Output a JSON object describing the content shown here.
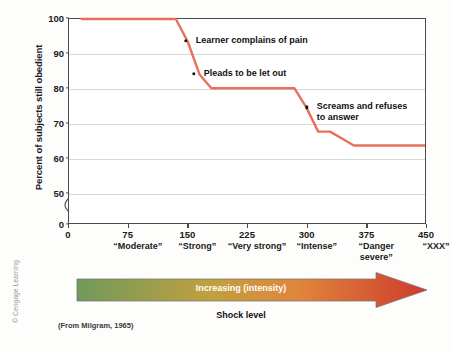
{
  "chart_data": {
    "type": "line",
    "title": "",
    "subtitle": "",
    "xlabel": "Shock level",
    "ylabel": "Percent of subjects still obedient",
    "xlim": [
      0,
      450
    ],
    "ylim": [
      0,
      100
    ],
    "y_axis_break": true,
    "y_axis_break_between": [
      0,
      50
    ],
    "grid": true,
    "grid_axis": "y",
    "legend": "none",
    "line_color": "#e8705a",
    "marker_color": "#111111",
    "x": [
      15,
      135,
      150,
      165,
      180,
      285,
      300,
      315,
      330,
      345,
      360,
      450
    ],
    "y": [
      100,
      100,
      93.5,
      84,
      80,
      80,
      74.5,
      67.5,
      67.5,
      65.5,
      63.5,
      63.5
    ],
    "series": [
      {
        "name": "Percent of subjects still obedient",
        "values": [
          100,
          100,
          93.5,
          84,
          80,
          80,
          74.5,
          67.5,
          67.5,
          65.5,
          63.5,
          63.5
        ]
      }
    ],
    "y_ticks": [
      0,
      50,
      60,
      70,
      80,
      90,
      100
    ],
    "x_ticks": [
      0,
      75,
      150,
      225,
      300,
      375,
      450
    ],
    "x_tick_words": [
      "",
      "“Moderate”",
      "“Strong”",
      "“Very strong”",
      "“Intense”",
      "“Danger\nsevere”",
      "“XXX”"
    ],
    "annotations": [
      {
        "text": "Learner complains of pain",
        "point_x": 148,
        "point_y": 93.5
      },
      {
        "text": "Pleads to be let out",
        "point_x": 158,
        "point_y": 84
      },
      {
        "text": "Screams and refuses\nto answer",
        "point_x": 300,
        "point_y": 74.5
      }
    ]
  },
  "axis": {
    "y_title": "Percent of subjects still obedient",
    "y_tick_labels": [
      "100",
      "90",
      "80",
      "70",
      "60",
      "50",
      "0"
    ],
    "x_tick_labels": [
      "0",
      "75",
      "150",
      "225",
      "300",
      "375",
      "450"
    ],
    "x_tick_words": [
      "",
      "“Moderate”",
      "“Strong”",
      "“Very strong”",
      "“Intense”",
      "“Danger\nsevere”",
      "“XXX”"
    ]
  },
  "annotations": {
    "learner_pain": "Learner complains of pain",
    "pleads": "Pleads to be let out",
    "screams": "Screams and refuses\nto answer"
  },
  "arrow": {
    "label": "Increasing (intensity)",
    "caption": "Shock level",
    "gradient_start": "#6f9a5c",
    "gradient_mid": "#c8a23c",
    "gradient_end": "#cf3a2e",
    "head_color": "#c8352e"
  },
  "footer": {
    "source": "(From Milgram, 1965)",
    "copyright": "© Cengage Learning"
  },
  "colors": {
    "line": "#e8705a",
    "grid": "#d8d8d8",
    "frame": "#4a4a4a",
    "text": "#1a1a1a"
  }
}
